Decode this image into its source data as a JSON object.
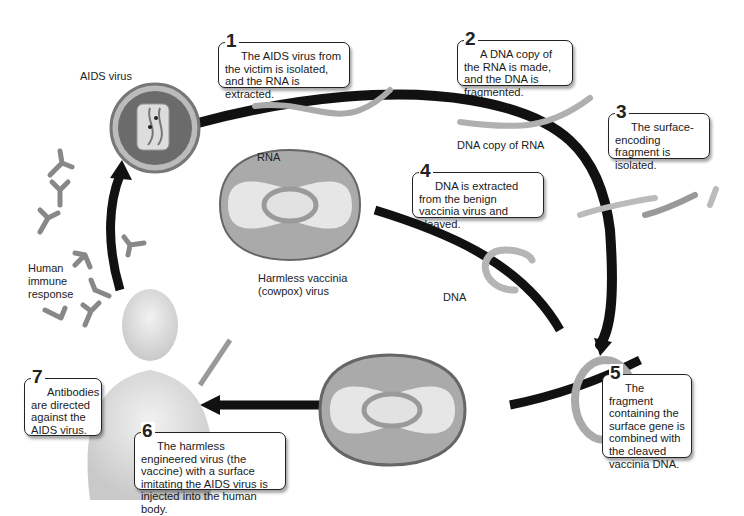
{
  "steps": [
    {
      "number": "1",
      "text": "The AIDS virus from the victim is isolated, and the RNA is extracted."
    },
    {
      "number": "2",
      "text": "A DNA copy of the RNA is made, and the DNA is fragmented."
    },
    {
      "number": "3",
      "text": "The surface-encoding fragment is isolated."
    },
    {
      "number": "4",
      "text": "DNA is extracted from the benign vaccinia virus and cleaved."
    },
    {
      "number": "5",
      "text": "The fragment containing the surface gene is combined with the cleaved vaccinia DNA."
    },
    {
      "number": "6",
      "text": "The harmless engineered virus (the vaccine) with a surface imitating the AIDS virus is injected into the human body."
    },
    {
      "number": "7",
      "text": "Antibodies are directed against the AIDS virus."
    }
  ],
  "labels": {
    "aids_virus": "AIDS virus",
    "rna": "RNA",
    "dna_copy": "DNA copy of RNA",
    "vaccinia_line1": "Harmless vaccinia",
    "vaccinia_line2": "(cowpox) virus",
    "dna": "DNA",
    "immune_line1": "Human",
    "immune_line2": "immune",
    "immune_line3": "response"
  },
  "colors": {
    "arrow": "#111111",
    "strand": "#b5b5b5",
    "virus_fill": "#c8c8c8",
    "box_border": "#222222"
  }
}
